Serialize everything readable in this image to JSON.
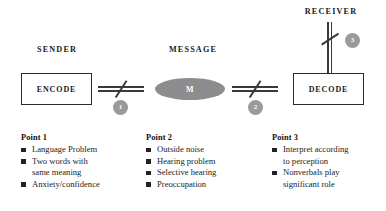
{
  "diagram": {
    "labels": {
      "sender": "SENDER",
      "message": "MESSAGE",
      "receiver": "RECEIVER"
    },
    "nodes": {
      "encode": "ENCODE",
      "message_symbol": "M",
      "decode": "DECODE"
    },
    "badges": {
      "one": "1",
      "two": "2",
      "three": "3"
    },
    "colors": {
      "badge_fill": "#9a9a9a",
      "ellipse_fill": "#8d8d8d",
      "line": "#3a3a3a",
      "box_border": "#2b2b2b",
      "text": "#1c1c1c",
      "bullet": "#222222"
    }
  },
  "columns": [
    {
      "title": "Point 1",
      "items": [
        {
          "line1": "Language Problem",
          "line2": ""
        },
        {
          "line1": "Two words with",
          "line2": "same meaning"
        },
        {
          "line1": "Anxiety/confidence",
          "line2": ""
        }
      ]
    },
    {
      "title": "Point 2",
      "items": [
        {
          "line1": "Outside noise",
          "line2": ""
        },
        {
          "line1": "Hearing problem",
          "line2": ""
        },
        {
          "line1": "Selective hearing",
          "line2": ""
        },
        {
          "line1": "Preoccupation",
          "line2": ""
        }
      ]
    },
    {
      "title": "Point 3",
      "items": [
        {
          "line1": "Interpret according",
          "line2": "to perception"
        },
        {
          "line1": "Nonverbals play",
          "line2": "significant role"
        }
      ]
    }
  ]
}
